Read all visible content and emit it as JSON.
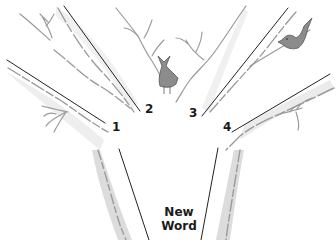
{
  "diagram": {
    "type": "tree-illustration",
    "trunk_label_line1": "New",
    "trunk_label_line2": "Word",
    "branches": [
      {
        "label": "1"
      },
      {
        "label": "2"
      },
      {
        "label": "3"
      },
      {
        "label": "4"
      }
    ],
    "colors": {
      "line": "#222222",
      "bark": "#9a9a9a",
      "shade": "#d8d8d8",
      "bird": "#8c8c8c"
    }
  }
}
